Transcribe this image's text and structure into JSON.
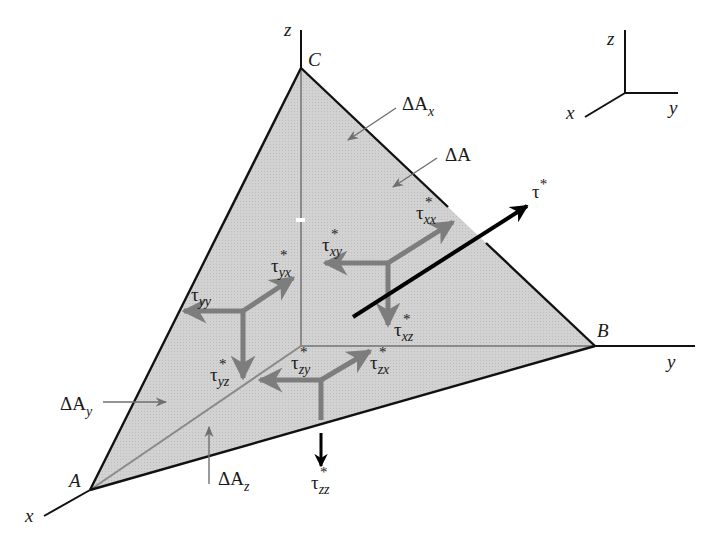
{
  "figure": {
    "colors": {
      "face_fill": "#cfcfcf",
      "outline": "#111111",
      "inner_edge": "#8a8a8a",
      "stress_arrow": "#7d7d7d",
      "resultant_arrow": "#000000"
    }
  },
  "axes": {
    "main": {
      "x": "x",
      "y": "y",
      "z": "z"
    },
    "triad": {
      "x": "x",
      "y": "y",
      "z": "z"
    }
  },
  "vertices": {
    "A": "A",
    "B": "B",
    "C": "C"
  },
  "areas": {
    "dA": {
      "base": "ΔA",
      "sub": ""
    },
    "dAx": {
      "base": "ΔA",
      "sub": "x"
    },
    "dAy": {
      "base": "ΔA",
      "sub": "y"
    },
    "dAz": {
      "base": "ΔA",
      "sub": "z"
    }
  },
  "stresses": {
    "tau_star": {
      "base": "τ",
      "sub": "",
      "sup": "*"
    },
    "tau_xx": {
      "base": "τ",
      "sub": "xx",
      "sup": "*"
    },
    "tau_xy": {
      "base": "τ",
      "sub": "xy",
      "sup": "*"
    },
    "tau_xz": {
      "base": "τ",
      "sub": "xz",
      "sup": "*"
    },
    "tau_yy": {
      "base": "τ",
      "sub": "yy",
      "sup": ""
    },
    "tau_yx": {
      "base": "τ",
      "sub": "yx",
      "sup": "*"
    },
    "tau_yz": {
      "base": "τ",
      "sub": "yz",
      "sup": "*"
    },
    "tau_zx": {
      "base": "τ",
      "sub": "zx",
      "sup": "*"
    },
    "tau_zy": {
      "base": "τ",
      "sub": "zy",
      "sup": "*"
    },
    "tau_zz": {
      "base": "τ",
      "sub": "zz",
      "sup": "*"
    }
  }
}
